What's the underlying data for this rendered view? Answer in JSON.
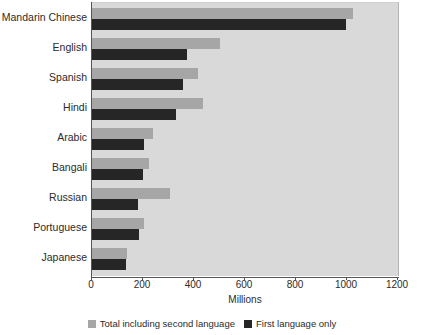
{
  "chart_data": {
    "type": "bar",
    "orientation": "horizontal",
    "title": "",
    "xlabel": "Millions",
    "ylabel": "",
    "xlim": [
      0,
      1200
    ],
    "xticks": [
      0,
      200,
      400,
      600,
      800,
      1000,
      1200
    ],
    "xtick_labels": [
      "0",
      "200",
      "400",
      "600",
      "800",
      "1000",
      "1200"
    ],
    "grid": false,
    "legend_position": "bottom",
    "categories": [
      "Mandarin Chinese",
      "English",
      "Spanish",
      "Hindi",
      "Arabic",
      "Bangali",
      "Russian",
      "Portuguese",
      "Japanese"
    ],
    "series": [
      {
        "name": "Total including second language",
        "color": "#a6a6a6",
        "values": [
          1025,
          500,
          415,
          435,
          240,
          225,
          305,
          205,
          137
        ]
      },
      {
        "name": "First language only",
        "color": "#262626",
        "values": [
          995,
          372,
          355,
          330,
          205,
          200,
          180,
          185,
          132
        ]
      }
    ]
  },
  "legend": {
    "items": [
      {
        "label": "Total including second language",
        "color": "#a6a6a6"
      },
      {
        "label": "First language only",
        "color": "#262626"
      }
    ]
  },
  "colors": {
    "plot_background": "#d9d9d9",
    "page_background": "#ffffff",
    "axis": "#555555",
    "text": "#2b2b2b"
  }
}
